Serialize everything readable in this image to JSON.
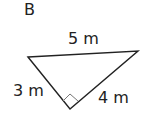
{
  "figure": {
    "label": "B",
    "sides": {
      "hypotenuse": "5 m",
      "left_leg": "3 m",
      "right_leg": "4 m"
    },
    "right_angle_marker": true
  }
}
